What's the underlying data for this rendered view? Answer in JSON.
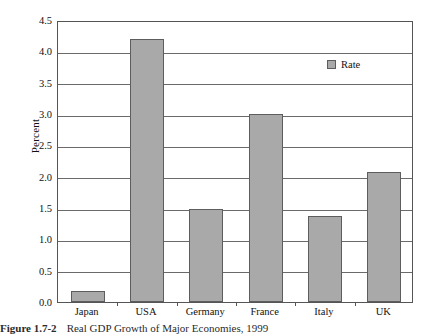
{
  "chart_data": {
    "type": "bar",
    "title": "",
    "xlabel": "",
    "ylabel": "Percent",
    "categories": [
      "Japan",
      "USA",
      "Germany",
      "France",
      "Italy",
      "UK"
    ],
    "values": [
      0.18,
      4.2,
      1.48,
      3.0,
      1.37,
      2.08
    ],
    "series": [
      {
        "name": "Rate",
        "values": [
          0.18,
          4.2,
          1.48,
          3.0,
          1.37,
          2.08
        ]
      }
    ],
    "ylim": [
      0.0,
      4.5
    ],
    "ytick_labels": [
      "4.5",
      "4.0",
      "3.5",
      "3.0",
      "2.5",
      "2.0",
      "1.5",
      "1.0",
      "0.5",
      "0.0"
    ],
    "ytick_values": [
      4.5,
      4.0,
      3.5,
      3.0,
      2.5,
      2.0,
      1.5,
      1.0,
      0.5,
      0.0
    ],
    "grid": true,
    "legend": {
      "position": "upper-right-inside",
      "entries": [
        "Rate"
      ]
    },
    "bar_color": "#a9a9a9",
    "bar_edge_color": "#5d5d5d",
    "axis_color": "#555555",
    "grid_color": "#6a6a6a"
  },
  "legend": {
    "label": "Rate"
  },
  "caption": {
    "figure_label": "Figure 1.7-2",
    "text": "Real GDP Growth of Major Economies, 1999"
  }
}
